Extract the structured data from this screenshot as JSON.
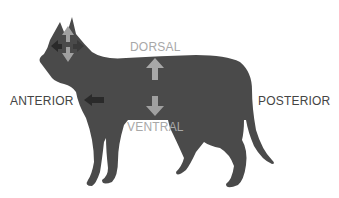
{
  "diagram": {
    "labels": {
      "dorsal": "DORSAL",
      "ventral": "VENTRAL",
      "anterior": "ANTERIOR",
      "posterior": "POSTERIOR"
    },
    "arrows": [
      {
        "name": "head-up-arrow",
        "direction": "up",
        "color": "#a0a0a0"
      },
      {
        "name": "head-down-arrow",
        "direction": "down",
        "color": "#a0a0a0"
      },
      {
        "name": "head-left-arrow",
        "direction": "left",
        "color": "#2a2a2a"
      },
      {
        "name": "head-right-arrow",
        "direction": "right",
        "color": "#444444"
      },
      {
        "name": "body-up-arrow",
        "direction": "up",
        "color": "#a8a8a8"
      },
      {
        "name": "body-down-arrow",
        "direction": "down",
        "color": "#a0a0a0"
      },
      {
        "name": "anterior-arrow",
        "direction": "left",
        "color": "#2a2a2a"
      }
    ],
    "colors": {
      "silhouette": "#4a4a4a",
      "light_label": "#a8a8a8",
      "dark_label": "#444444"
    }
  }
}
